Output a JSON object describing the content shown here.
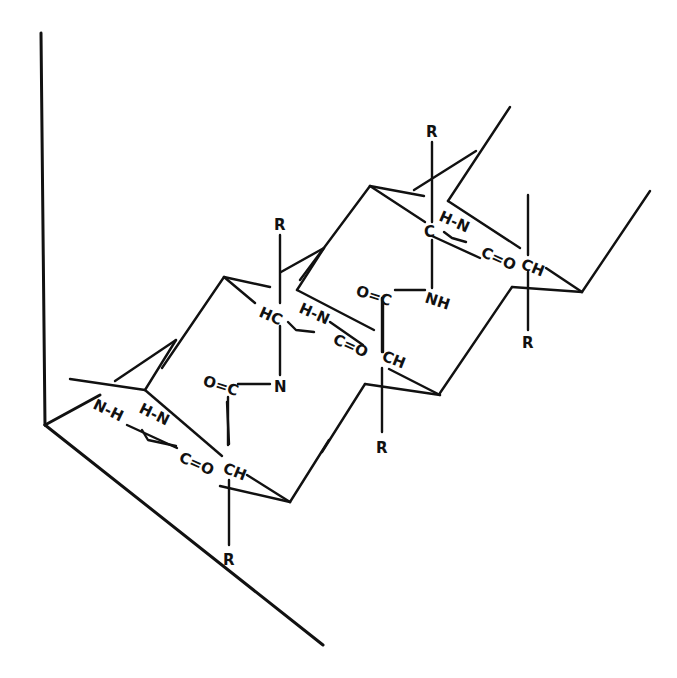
{
  "diagram": {
    "title": "",
    "colors": {
      "ink": "#111111",
      "background": "#ffffff"
    },
    "labels": {
      "r_top_right": "R",
      "r_mid_top": "R",
      "r_mid_bottom": "R",
      "r_right": "R",
      "r_bottom": "R",
      "unit3_hn": "H-N",
      "unit3_c": "C",
      "unit3_co": "C=O",
      "unit3_ch": "CH",
      "unit3_oc": "O=C",
      "unit3_nh": "NH",
      "unit2_hc": "HC",
      "unit2_hn": "H-N",
      "unit2_co": "C=O",
      "unit2_ch": "CH",
      "unit2_oc": "O=C",
      "unit2_n": "N",
      "unit1_nh": "N-H",
      "unit1_hn": "H-N",
      "unit1_co": "C=O",
      "unit1_ch": "CH"
    }
  }
}
